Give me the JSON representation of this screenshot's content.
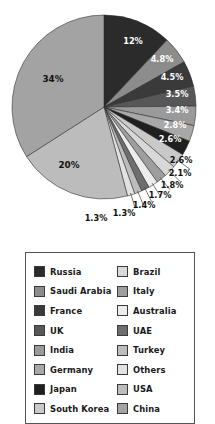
{
  "chart_data": {
    "type": "pie",
    "title": "",
    "subtitle": "",
    "xlabel": "",
    "ylabel": "",
    "legend_position": "bottom",
    "grid": false,
    "categories": [
      "Russia",
      "Saudi Arabia",
      "France",
      "UK",
      "India",
      "Germany",
      "Japan",
      "South Korea",
      "Brazil",
      "Italy",
      "Australia",
      "UAE",
      "Turkey",
      "Others",
      "USA",
      "China"
    ],
    "values": [
      12,
      4.8,
      4.5,
      3.5,
      3.4,
      2.8,
      2.6,
      2.6,
      2.1,
      1.8,
      1.7,
      1.4,
      1.3,
      1.3,
      20,
      34
    ],
    "value_labels": [
      "12%",
      "4.8%",
      "4.5%",
      "3.5%",
      "3.4%",
      "2.8%",
      "2.6%",
      "2.6%",
      "2.1%",
      "1.8%",
      "1.7%",
      "1.4%",
      "1.3%",
      "1.3%",
      "20%",
      "34%"
    ],
    "colors": [
      "#2b2b2b",
      "#8c8c8c",
      "#3a3a3a",
      "#575757",
      "#9a9a9a",
      "#a8a8a8",
      "#1f1f1f",
      "#c9c9c9",
      "#d8d8d8",
      "#9e9e9e",
      "#ececec",
      "#6e6e6e",
      "#bdbdbd",
      "#e2e2e2",
      "#bcbcbc",
      "#a3a3a3"
    ],
    "inner_labels": [
      "12%",
      "4.8%",
      "4.5%",
      "3.5%",
      "3.4%",
      "2.8%",
      "2.6%"
    ],
    "outer_labels": [
      "2.6%",
      "2.1%",
      "1.8%",
      "1.7%",
      "1.4%",
      "1.3%",
      "1.3%"
    ],
    "big_labels": [
      "34%",
      "20%"
    ]
  },
  "pie": {
    "slices": [
      {
        "id": "slice-12",
        "label": "12%",
        "value": 12,
        "color": "#2b2b2b",
        "label_kind": "inner-light",
        "lx": 133,
        "ly": 44
      },
      {
        "id": "slice-48",
        "label": "4.8%",
        "value": 4.8,
        "color": "#8c8c8c",
        "label_kind": "inner-light",
        "lx": 162,
        "ly": 62
      },
      {
        "id": "slice-45",
        "label": "4.5%",
        "value": 4.5,
        "color": "#3a3a3a",
        "label_kind": "inner-light",
        "lx": 172,
        "ly": 80
      },
      {
        "id": "slice-35",
        "label": "3.5%",
        "value": 3.5,
        "color": "#575757",
        "label_kind": "inner-light",
        "lx": 177,
        "ly": 97
      },
      {
        "id": "slice-34b",
        "label": "3.4%",
        "value": 3.4,
        "color": "#9a9a9a",
        "label_kind": "inner-light",
        "lx": 177,
        "ly": 113
      },
      {
        "id": "slice-28",
        "label": "2.8%",
        "value": 2.8,
        "color": "#a8a8a8",
        "label_kind": "inner-light",
        "lx": 175,
        "ly": 128
      },
      {
        "id": "slice-26a",
        "label": "2.6%",
        "value": 2.6,
        "color": "#1f1f1f",
        "label_kind": "inner-light",
        "lx": 170,
        "ly": 142
      },
      {
        "id": "slice-26b",
        "label": "2.6%",
        "value": 2.6,
        "color": "#c9c9c9",
        "label_kind": "outer",
        "lx": 181,
        "ly": 163
      },
      {
        "id": "slice-21",
        "label": "2.1%",
        "value": 2.1,
        "color": "#d8d8d8",
        "label_kind": "outer",
        "lx": 180,
        "ly": 176
      },
      {
        "id": "slice-18",
        "label": "1.8%",
        "value": 1.8,
        "color": "#9e9e9e",
        "label_kind": "outer",
        "lx": 172,
        "ly": 188
      },
      {
        "id": "slice-17",
        "label": "1.7%",
        "value": 1.7,
        "color": "#ececec",
        "label_kind": "outer",
        "lx": 160,
        "ly": 198
      },
      {
        "id": "slice-14",
        "label": "1.4%",
        "value": 1.4,
        "color": "#6e6e6e",
        "label_kind": "outer",
        "lx": 144,
        "ly": 208
      },
      {
        "id": "slice-13a",
        "label": "1.3%",
        "value": 1.3,
        "color": "#bdbdbd",
        "label_kind": "outer",
        "lx": 124,
        "ly": 216
      },
      {
        "id": "slice-13b",
        "label": "1.3%",
        "value": 1.3,
        "color": "#e2e2e2",
        "label_kind": "outer",
        "lx": 96,
        "ly": 221
      },
      {
        "id": "slice-20",
        "label": "20%",
        "value": 20,
        "color": "#bcbcbc",
        "label_kind": "inner-dark",
        "lx": 69,
        "ly": 168
      },
      {
        "id": "slice-34a",
        "label": "34%",
        "value": 34,
        "color": "#a3a3a3",
        "label_kind": "inner-dark",
        "lx": 53,
        "ly": 82
      }
    ]
  },
  "legend": {
    "items": [
      {
        "label": "Russia",
        "color": "#2b2b2b"
      },
      {
        "label": "Brazil",
        "color": "#d8d8d8"
      },
      {
        "label": "Saudi Arabia",
        "color": "#8c8c8c"
      },
      {
        "label": "Italy",
        "color": "#9e9e9e"
      },
      {
        "label": "France",
        "color": "#3a3a3a"
      },
      {
        "label": "Australia",
        "color": "#ececec"
      },
      {
        "label": "UK",
        "color": "#575757"
      },
      {
        "label": "UAE",
        "color": "#6e6e6e"
      },
      {
        "label": "India",
        "color": "#9a9a9a"
      },
      {
        "label": "Turkey",
        "color": "#bdbdbd"
      },
      {
        "label": "Germany",
        "color": "#a8a8a8"
      },
      {
        "label": "Others",
        "color": "#e2e2e2"
      },
      {
        "label": "Japan",
        "color": "#1f1f1f"
      },
      {
        "label": "USA",
        "color": "#bcbcbc"
      },
      {
        "label": "South Korea",
        "color": "#c9c9c9"
      },
      {
        "label": "China",
        "color": "#a3a3a3"
      }
    ]
  }
}
